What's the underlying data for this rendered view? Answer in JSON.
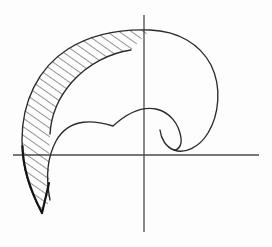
{
  "figure": {
    "domain": "Diagram",
    "width": 272,
    "height": 247,
    "background_color": "#fdfdfd",
    "line_color": "#2b2b2b",
    "axis_color": "#4a4a4a",
    "hatch_color": "#2b2b2b",
    "caption": ""
  },
  "axes": {
    "origin": {
      "x": 144,
      "y": 155
    },
    "vertical": {
      "x": 144,
      "y_top": 15,
      "y_bottom": 232
    },
    "horizontal": {
      "y": 155,
      "x_left": 13,
      "x_right": 259
    },
    "labels": {
      "x_axis": "",
      "y_axis": "",
      "origin": ""
    }
  },
  "geometry": {
    "outer_profile": {
      "name": "outer-hook-curve",
      "leftmost_x": 22,
      "topmost_y": 30,
      "rightmost_x": 218,
      "tail_tip": {
        "x": 42,
        "y": 213
      },
      "path": "M 42 213 C 30 190 22 170 22 140 C 22 102 38 68 68 49 C 95 32 124 29 150 30 C 178 31 200 44 211 65 C 222 87 219 115 208 133 C 199 148 184 154 174 150 C 166 147 161 139 160 130"
    },
    "inner_profile": {
      "name": "inner-lobe-curve",
      "notch": {
        "x": 113,
        "y": 126
      },
      "free_tip": {
        "x": 131,
        "y": 50
      },
      "path": "M 131 50 C 110 53 88 64 72 82 C 58 98 51 116 50 134"
    },
    "lobe_profile": {
      "name": "inner-scallop-curve",
      "path": "M 50 200 C 46 180 47 158 56 141 C 70 116 96 121 113 126 C 124 116 140 106 156 109 C 170 112 179 124 181 138 C 182 146 178 150 174 150"
    },
    "hatched_region": {
      "name": "crescent-hatch-section",
      "hatch_angle_deg": 55,
      "hatch_spacing_px": 7,
      "hatch_count": 22,
      "description": "Crescent-shaped cross-section between outer hook curve and inner lobe curve"
    }
  },
  "elements": {
    "outer_outline_name": "outer-profile-outline",
    "inner_outline_name": "inner-profile-outline",
    "lobe_outline_name": "scallop-profile-outline",
    "tail_name": "tail-spur",
    "hatch_name": "section-hatching",
    "vertical_axis_name": "vertical-axis",
    "horizontal_axis_name": "horizontal-axis"
  }
}
